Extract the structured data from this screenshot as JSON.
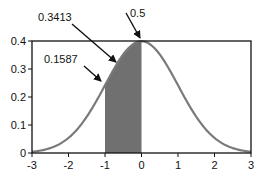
{
  "chart_data": {
    "type": "line",
    "title": "",
    "xlabel": "",
    "ylabel": "",
    "xlim": [
      -3,
      3
    ],
    "ylim": [
      0,
      0.4
    ],
    "x_ticks": [
      -3,
      -2,
      -1,
      0,
      1,
      2,
      3
    ],
    "x_tick_labels": [
      "-3",
      "-2",
      "-1",
      "0",
      "1",
      "2",
      "3"
    ],
    "y_ticks": [
      0,
      0.1,
      0.2,
      0.3,
      0.4
    ],
    "y_tick_labels": [
      "0",
      "0.1",
      "0.2",
      "0.3",
      "0.4"
    ],
    "series": [
      {
        "name": "Standard normal density",
        "function": "normal_pdf",
        "mean": 0,
        "sd": 1,
        "color": "#7a7a7a"
      }
    ],
    "shaded_region": {
      "x_from": -1,
      "x_to": 0,
      "color": "#707070"
    },
    "annotations": [
      {
        "text": "0.5",
        "points_to": [
          0,
          0.3989
        ]
      },
      {
        "text": "0.3413",
        "points_to": [
          -0.3,
          0.3
        ]
      },
      {
        "text": "0.1587",
        "points_to": [
          -1,
          0.242
        ]
      }
    ],
    "grid": false,
    "legend": "none"
  }
}
